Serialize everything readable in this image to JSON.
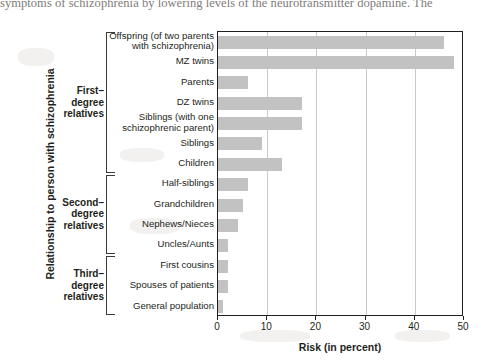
{
  "page_text": "symptoms of schizophrenia by lowering levels of the neurotransmitter dopamine. The",
  "chart_data": {
    "type": "bar",
    "orientation": "horizontal",
    "title": "",
    "xlabel": "Risk (in percent)",
    "ylabel": "Relationship to person with schizophrenia",
    "xlim": [
      0,
      50
    ],
    "xticks": [
      0,
      10,
      20,
      30,
      40,
      50
    ],
    "xtick_labels": [
      "0",
      "10",
      "20",
      "30",
      "40",
      "50"
    ],
    "grid": true,
    "grid_axis": "x",
    "legend": null,
    "bar_color": "#c2c2c2",
    "axis_color": "#231f20",
    "categories": [
      "Offspring (of two parents with schizophrenia)",
      "MZ twins",
      "Parents",
      "DZ twins",
      "Siblings (with one schizophrenic parent)",
      "Siblings",
      "Children",
      "Half-siblings",
      "Grandchildren",
      "Nephews/Nieces",
      "Uncles/Aunts",
      "First cousins",
      "Spouses of patients",
      "General population"
    ],
    "values": [
      46,
      48,
      6,
      17,
      17,
      9,
      13,
      6,
      5,
      4,
      2,
      2,
      2,
      1
    ],
    "groups": [
      {
        "label": "First–\ndegree\nrelatives",
        "label_lines": [
          "First–",
          "degree",
          "relatives"
        ],
        "start_index": 0,
        "end_index": 6
      },
      {
        "label": "Second–\ndegree\nrelatives",
        "label_lines": [
          "Second–",
          "degree",
          "relatives"
        ],
        "start_index": 7,
        "end_index": 10
      },
      {
        "label": "Third–\ndegree\nrelatives",
        "label_lines": [
          "Third–",
          "degree",
          "relatives"
        ],
        "start_index": 11,
        "end_index": 13
      }
    ]
  },
  "category_label_lines": [
    [
      "Offspring (of two parents",
      "with schizophrenia)"
    ],
    [
      "MZ twins"
    ],
    [
      "Parents"
    ],
    [
      "DZ twins"
    ],
    [
      "Siblings (with one",
      "schizophrenic parent)"
    ],
    [
      "Siblings"
    ],
    [
      "Children"
    ],
    [
      "Half-siblings"
    ],
    [
      "Grandchildren"
    ],
    [
      "Nephews/Nieces"
    ],
    [
      "Uncles/Aunts"
    ],
    [
      "First cousins"
    ],
    [
      "Spouses  of patients"
    ],
    [
      "General population"
    ]
  ]
}
